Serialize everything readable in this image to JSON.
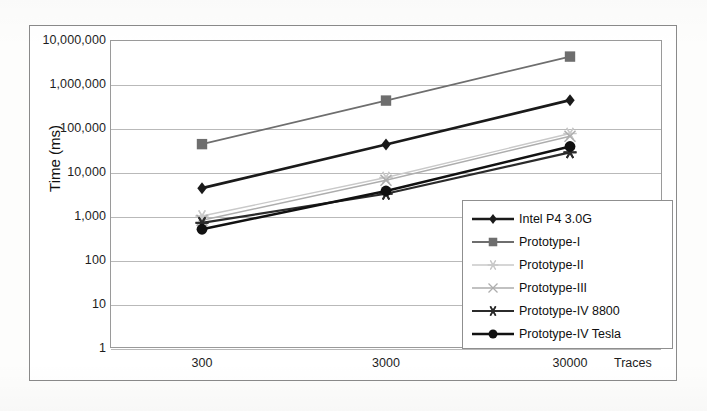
{
  "chart_data": {
    "type": "line",
    "title": "",
    "xlabel": "Traces",
    "ylabel": "Time (ms)",
    "x_scale": "categorical",
    "y_scale": "log",
    "ylim": [
      1,
      10000000
    ],
    "grid": true,
    "legend_position": "inside-bottom-right",
    "categories": [
      "300",
      "3000",
      "30000"
    ],
    "ytick_labels": [
      "10,000,000",
      "1,000,000",
      "100,000",
      "10,000",
      "1,000",
      "100",
      "10",
      "1"
    ],
    "ytick_values": [
      10000000,
      1000000,
      100000,
      10000,
      1000,
      100,
      10,
      1
    ],
    "series": [
      {
        "name": "Intel P4 3.0G",
        "marker": "diamond",
        "color": "#1a1a1a",
        "width": 2.6,
        "values": [
          4300,
          42000,
          430000
        ]
      },
      {
        "name": "Prototype-I",
        "marker": "square",
        "color": "#6e6e6e",
        "width": 1.8,
        "values": [
          43000,
          420000,
          4200000
        ]
      },
      {
        "name": "Prototype-II",
        "marker": "star",
        "color": "#c9c9c9",
        "width": 1.4,
        "values": [
          1000,
          7500,
          75000
        ]
      },
      {
        "name": "Prototype-III",
        "marker": "cross",
        "color": "#adadad",
        "width": 1.4,
        "values": [
          800,
          6500,
          65000
        ]
      },
      {
        "name": "Prototype-IV 8800",
        "marker": "asterisk",
        "color": "#2b2b2b",
        "width": 2.2,
        "values": [
          700,
          3200,
          28000
        ]
      },
      {
        "name": "Prototype-IV Tesla",
        "marker": "circle",
        "color": "#111111",
        "width": 2.4,
        "values": [
          500,
          3700,
          38000
        ]
      }
    ]
  },
  "axis": {
    "y_title": "Time (ms)",
    "x_title": "Traces"
  }
}
